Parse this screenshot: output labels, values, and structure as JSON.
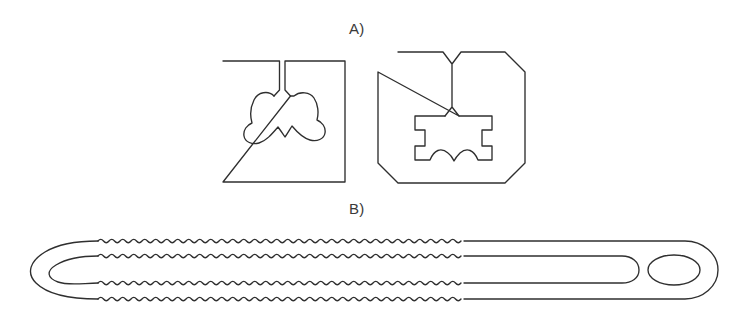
{
  "figure": {
    "type": "technical-line-drawing",
    "background_color": "#ffffff",
    "line_color": "#2f2f2f",
    "width": 732,
    "height": 321,
    "panels": [
      {
        "id": "A",
        "label": "A)",
        "label_x": 349,
        "label_y": 20,
        "description": "Two flat outline profiles: a square plate with a slot and molar-tooth shaped cavity, and an octagonal plate with a V-notch and T-slot cavity with scalloped floor.",
        "shapes": [
          {
            "name": "square-plate-with-tooth-cavity",
            "outline": "square",
            "x": 223,
            "y": 61,
            "width": 122,
            "height": 121,
            "features": [
              "top-center vertical slot",
              "molar-tooth shaped interior cavity",
              "two rounded lobes",
              "central bottom V-cusp"
            ]
          },
          {
            "name": "octagon-plate-with-tslot-cavity",
            "outline": "octagon",
            "x": 378,
            "y": 52,
            "width": 147,
            "height": 131,
            "features": [
              "top-center V notch",
              "rectangular cavity",
              "left and right side notches",
              "double-scallop floor"
            ]
          }
        ]
      },
      {
        "id": "B",
        "label": "B)",
        "label_x": 349,
        "label_y": 200,
        "description": "Elongated serrated strap with a hairpin U-turn at the left end, four wavy serrated edges along the body, a straight smooth tail and a rounded terminal tab with an oval through-hole.",
        "shapes": [
          {
            "name": "serrated-strap-band",
            "x": 16,
            "y": 236,
            "width": 702,
            "height": 66,
            "features": [
              "hairpin U-turn left end",
              "inner longitudinal slot",
              "four wavy serrated edges",
              "smooth straight right tail",
              "rounded terminal tab",
              "oval through-hole"
            ],
            "wave": {
              "start_x": 98,
              "end_x": 466,
              "period": 11,
              "amplitude": 3.4,
              "cycles": 33
            },
            "edges_y": [
              241,
              256,
              283,
              297
            ],
            "oval_hole": {
              "cx": 674,
              "cy": 270,
              "rx": 26,
              "ry": 15
            }
          }
        ]
      }
    ]
  }
}
